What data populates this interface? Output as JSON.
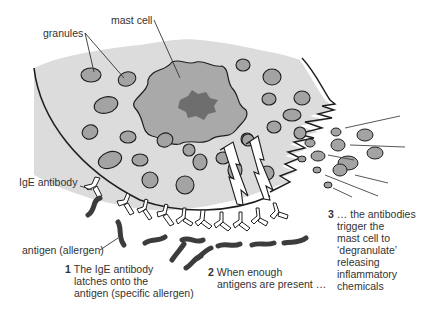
{
  "labels": {
    "granules": "granules",
    "mast_cell": "mast cell",
    "ige_antibody": "IgE antibody",
    "antigen": "antigen (allergen)"
  },
  "steps": [
    {
      "number": "1",
      "lines": [
        "The IgE antibody",
        "latches onto the",
        "antigen (specific allergen)"
      ]
    },
    {
      "number": "2",
      "lines": [
        "When enough",
        "antigens are present …"
      ]
    },
    {
      "number": "3",
      "lines": [
        "… the antibodies",
        "trigger the",
        "mast cell to",
        "‘degranulate’",
        "releasing",
        "inflammatory",
        "chemicals"
      ]
    }
  ],
  "colors": {
    "cytoplasm": "#dcdcdc",
    "nucleus_outer": "#a9a9a9",
    "nucleus_inner": "#6e6e6e",
    "granule": "#a3a3a3",
    "antigen": "#3c3c3c",
    "outline": "#1e1e1e"
  }
}
